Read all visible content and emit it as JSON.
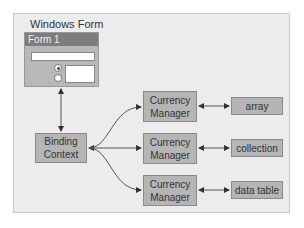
{
  "diagram": {
    "frame_title": "Windows Form",
    "form": {
      "title": "Form 1"
    },
    "binding_context": {
      "label_line1": "Binding",
      "label_line2": "Context"
    },
    "currency_managers": [
      {
        "line1": "Currency",
        "line2": "Manager"
      },
      {
        "line1": "Currency",
        "line2": "Manager"
      },
      {
        "line1": "Currency",
        "line2": "Manager"
      }
    ],
    "data_sources": [
      {
        "label": "array"
      },
      {
        "label": "collection"
      },
      {
        "label": "data table"
      }
    ],
    "colors": {
      "box_fill": "#b5b5b5",
      "title_bar": "#7d7d7d",
      "frame_bg": "#ececec",
      "arrow": "#333333"
    }
  }
}
